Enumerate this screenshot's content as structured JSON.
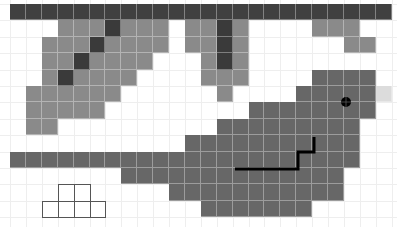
{
  "board": {
    "origin_x": 10,
    "origin_y": 4,
    "cell_w": 15.9,
    "cell_h": 16.4,
    "cols": 24,
    "rows": 14,
    "colors": {
      "background": "#ffffff",
      "gridline": "#eeeeee",
      "wall": "#404040",
      "terrain_light": "#8a8a8a",
      "terrain_dark": "#3a3a3a",
      "region": "#676767",
      "highlight": "#dcdcdc",
      "path": "#000000",
      "outline": "#555555"
    },
    "tiles": [
      {
        "row": 0,
        "from": 0,
        "to": 23,
        "type": "wall"
      },
      {
        "row": 1,
        "from": 3,
        "to": 9,
        "type": "terrain_light"
      },
      {
        "row": 1,
        "from": 6,
        "to": 6,
        "type": "terrain_dark"
      },
      {
        "row": 1,
        "from": 11,
        "to": 14,
        "type": "terrain_light"
      },
      {
        "row": 1,
        "from": 13,
        "to": 13,
        "type": "terrain_dark"
      },
      {
        "row": 1,
        "from": 19,
        "to": 21,
        "type": "terrain_light"
      },
      {
        "row": 2,
        "from": 2,
        "to": 9,
        "type": "terrain_light"
      },
      {
        "row": 2,
        "from": 5,
        "to": 5,
        "type": "terrain_dark"
      },
      {
        "row": 2,
        "from": 11,
        "to": 14,
        "type": "terrain_light"
      },
      {
        "row": 2,
        "from": 13,
        "to": 13,
        "type": "terrain_dark"
      },
      {
        "row": 2,
        "from": 21,
        "to": 22,
        "type": "terrain_light"
      },
      {
        "row": 3,
        "from": 2,
        "to": 8,
        "type": "terrain_light"
      },
      {
        "row": 3,
        "from": 4,
        "to": 4,
        "type": "terrain_dark"
      },
      {
        "row": 3,
        "from": 12,
        "to": 14,
        "type": "terrain_light"
      },
      {
        "row": 3,
        "from": 13,
        "to": 13,
        "type": "terrain_dark"
      },
      {
        "row": 4,
        "from": 2,
        "to": 7,
        "type": "terrain_light"
      },
      {
        "row": 4,
        "from": 3,
        "to": 3,
        "type": "terrain_dark"
      },
      {
        "row": 4,
        "from": 12,
        "to": 14,
        "type": "terrain_light"
      },
      {
        "row": 4,
        "from": 19,
        "to": 22,
        "type": "region"
      },
      {
        "row": 5,
        "from": 1,
        "to": 6,
        "type": "terrain_light"
      },
      {
        "row": 5,
        "from": 13,
        "to": 13,
        "type": "terrain_light"
      },
      {
        "row": 5,
        "from": 18,
        "to": 22,
        "type": "region"
      },
      {
        "row": 5,
        "from": 23,
        "to": 23,
        "type": "highlight"
      },
      {
        "row": 6,
        "from": 1,
        "to": 5,
        "type": "terrain_light"
      },
      {
        "row": 6,
        "from": 15,
        "to": 22,
        "type": "region"
      },
      {
        "row": 7,
        "from": 1,
        "to": 2,
        "type": "terrain_light"
      },
      {
        "row": 7,
        "from": 13,
        "to": 21,
        "type": "region"
      },
      {
        "row": 8,
        "from": 11,
        "to": 21,
        "type": "region"
      },
      {
        "row": 9,
        "from": 0,
        "to": 21,
        "type": "region"
      },
      {
        "row": 10,
        "from": 7,
        "to": 20,
        "type": "region"
      },
      {
        "row": 11,
        "from": 10,
        "to": 20,
        "type": "region"
      },
      {
        "row": 12,
        "from": 12,
        "to": 18,
        "type": "region"
      }
    ],
    "outline_piece": [
      {
        "row": 11,
        "col": 3
      },
      {
        "row": 11,
        "col": 4
      },
      {
        "row": 12,
        "col": 2
      },
      {
        "row": 12,
        "col": 3
      },
      {
        "row": 12,
        "col": 4
      },
      {
        "row": 12,
        "col": 5
      }
    ],
    "path_points": [
      [
        235,
        169
      ],
      [
        298,
        169
      ],
      [
        298,
        152
      ],
      [
        314,
        152
      ],
      [
        314,
        137
      ]
    ],
    "player": {
      "x": 346,
      "y": 102,
      "r": 5,
      "icon": "crosshair-target-icon"
    }
  }
}
